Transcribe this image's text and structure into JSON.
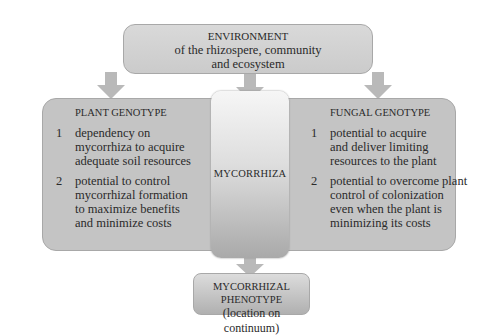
{
  "environment": {
    "title": "ENVIRONMENT",
    "subtitle_line1": "of the rhizospere, community",
    "subtitle_line2": "and ecosystem"
  },
  "plant_genotype": {
    "title": "PLANT GENOTYPE",
    "items": [
      {
        "num": "1",
        "text": "dependency on\nmycorrhiza to acquire\nadequate soil resources"
      },
      {
        "num": "2",
        "text": "potential to control\nmycorrhizal formation\nto maximize benefits\nand minimize costs"
      }
    ]
  },
  "mycorrhiza": {
    "label": "MYCORRHIZA"
  },
  "fungal_genotype": {
    "title": "FUNGAL GENOTYPE",
    "items": [
      {
        "num": "1",
        "text": "potential to acquire\nand deliver limiting\nresources to the plant"
      },
      {
        "num": "2",
        "text": "potential to overcome plant\ncontrol of colonization\neven when the plant is\nminimizing its costs"
      }
    ]
  },
  "phenotype": {
    "title": "MYCORRHIZAL PHENOTYPE",
    "subtitle": "(location on continuum)"
  },
  "colors": {
    "box_fill": "#cbcbcb",
    "arrow_fill": "#b9b9b9",
    "border": "#a8a8a8"
  }
}
